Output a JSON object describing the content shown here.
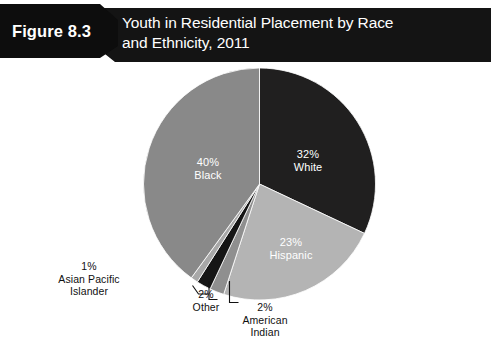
{
  "header": {
    "figure_number": "Figure 8.3",
    "title_line1": "Youth in Residential Placement by Race",
    "title_line2": "and Ethnicity, 2011",
    "bar_color": "#141414",
    "text_color": "#ffffff"
  },
  "chart_data": {
    "type": "pie",
    "title": "Youth in Residential Placement by Race and Ethnicity, 2011",
    "xlabel": "",
    "ylabel": "",
    "legend": "none",
    "grid": false,
    "units": "percent",
    "start_angle_deg": 0,
    "direction": "clockwise",
    "categories": [
      "White",
      "Hispanic",
      "American Indian",
      "Other",
      "Asian Pacific Islander",
      "Black"
    ],
    "values": [
      32,
      23,
      2,
      2,
      1,
      40
    ],
    "slices": [
      {
        "name": "White",
        "value": 32,
        "value_label": "32%",
        "color": "#201f1f",
        "label_placement": "inside",
        "label_color": "#ffffff"
      },
      {
        "name": "Hispanic",
        "value": 23,
        "value_label": "23%",
        "color": "#b4b4b4",
        "label_placement": "inside",
        "label_color": "#ffffff"
      },
      {
        "name": "American Indian",
        "value": 2,
        "value_label": "2%",
        "color": "#8f8f8f",
        "label_placement": "callout",
        "label_color": "#101010"
      },
      {
        "name": "Other",
        "value": 2,
        "value_label": "2%",
        "color": "#151515",
        "label_placement": "callout",
        "label_color": "#101010"
      },
      {
        "name": "Asian Pacific Islander",
        "value": 1,
        "value_label": "1%",
        "color": "#a8a8a8",
        "label_placement": "callout",
        "label_color": "#101010"
      },
      {
        "name": "Black",
        "value": 40,
        "value_label": "40%",
        "color": "#898989",
        "label_placement": "inside",
        "label_color": "#ffffff"
      }
    ]
  },
  "labels": {
    "white_pct": "32%",
    "white_name": "White",
    "hispanic_pct": "23%",
    "hispanic_name": "Hispanic",
    "black_pct": "40%",
    "black_name": "Black",
    "api_pct": "1%",
    "api_name_line1": "Asian Pacific",
    "api_name_line2": "Islander",
    "other_pct": "2%",
    "other_name": "Other",
    "amind_pct": "2%",
    "amind_name_line1": "American",
    "amind_name_line2": "Indian"
  },
  "background_color": "#ffffff"
}
